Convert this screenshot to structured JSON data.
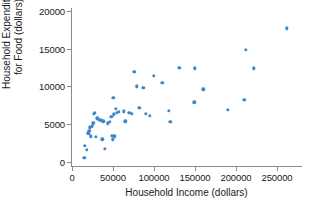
{
  "chart_data": {
    "type": "scatter",
    "title": "",
    "xlabel": "Household Income (dollars)",
    "ylabel_line1": "Household Expenditure",
    "ylabel_line2": "for Food (dollars)",
    "ylabel": "Household Expenditure for Food (dollars)",
    "xlim": [
      0,
      270000
    ],
    "ylim": [
      0,
      20000
    ],
    "xticks": [
      0,
      50000,
      100000,
      150000,
      200000,
      250000
    ],
    "xticklabels": [
      "0",
      "50000",
      "100000",
      "150000",
      "200000",
      "250000"
    ],
    "yticks": [
      0,
      5000,
      10000,
      15000,
      20000
    ],
    "yticklabels": [
      "0",
      "5000",
      "10000",
      "15000",
      "20000"
    ],
    "grid": false,
    "legend": null,
    "marker_color": "#3d87c8",
    "marker_size": 3.4,
    "points": [
      [
        15000,
        600
      ],
      [
        16000,
        2100
      ],
      [
        18000,
        1600
      ],
      [
        20000,
        3800
      ],
      [
        21000,
        4100
      ],
      [
        22000,
        4600
      ],
      [
        23000,
        3400
      ],
      [
        24000,
        4700
      ],
      [
        25000,
        4900
      ],
      [
        26000,
        5200
      ],
      [
        27000,
        6400
      ],
      [
        28000,
        6500
      ],
      [
        29000,
        3300
      ],
      [
        31000,
        5800
      ],
      [
        33000,
        5600
      ],
      [
        35000,
        5500
      ],
      [
        37000,
        3000
      ],
      [
        38000,
        5400
      ],
      [
        40000,
        1700
      ],
      [
        44000,
        5100
      ],
      [
        46000,
        5300
      ],
      [
        48000,
        6000
      ],
      [
        49000,
        3500
      ],
      [
        50000,
        3000
      ],
      [
        50500,
        8500
      ],
      [
        51000,
        6300
      ],
      [
        52000,
        3400
      ],
      [
        53000,
        7000
      ],
      [
        55000,
        6500
      ],
      [
        57000,
        6600
      ],
      [
        63000,
        6700
      ],
      [
        65000,
        5400
      ],
      [
        70000,
        6500
      ],
      [
        73000,
        6400
      ],
      [
        76000,
        11900
      ],
      [
        79000,
        10000
      ],
      [
        82000,
        7200
      ],
      [
        87000,
        9800
      ],
      [
        90000,
        6400
      ],
      [
        95000,
        6100
      ],
      [
        100000,
        11400
      ],
      [
        110000,
        10500
      ],
      [
        118000,
        6800
      ],
      [
        120000,
        5300
      ],
      [
        131000,
        12500
      ],
      [
        149000,
        7900
      ],
      [
        150000,
        12400
      ],
      [
        160000,
        9600
      ],
      [
        190000,
        6900
      ],
      [
        210000,
        8200
      ],
      [
        212000,
        14800
      ],
      [
        222000,
        12400
      ],
      [
        262000,
        17700
      ]
    ]
  }
}
